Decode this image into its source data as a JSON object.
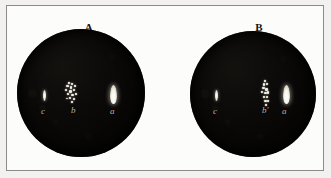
{
  "plate": {
    "background_color": "#fcfcfb",
    "frame_color": "#8b8b8b",
    "disk_color": "#0a0908",
    "highlight_color": "#ffffff"
  },
  "figures": [
    {
      "id": "figure-a",
      "title": "A",
      "disk": {
        "x": 17,
        "y": 29,
        "diameter": 128
      },
      "features": [
        {
          "key": "c",
          "label": "c",
          "type": "slit",
          "x": 43,
          "y": 90,
          "label_x": 41,
          "label_y": 107
        },
        {
          "key": "b",
          "label": "b",
          "type": "cluster",
          "x": 64,
          "y": 82,
          "label_x": 71,
          "label_y": 106
        },
        {
          "key": "a",
          "label": "a",
          "type": "teardrop",
          "x": 110,
          "y": 85,
          "label_x": 110,
          "label_y": 107
        }
      ]
    },
    {
      "id": "figure-b",
      "title": "B",
      "disk": {
        "x": 190,
        "y": 31,
        "diameter": 126
      },
      "features": [
        {
          "key": "c",
          "label": "c",
          "type": "slit",
          "x": 215,
          "y": 90,
          "label_x": 213,
          "label_y": 107
        },
        {
          "key": "b-prime",
          "label": "b'",
          "type": "cluster",
          "x": 260,
          "y": 80,
          "label_x": 262,
          "label_y": 106
        },
        {
          "key": "a",
          "label": "a",
          "type": "teardrop",
          "x": 283,
          "y": 85,
          "label_x": 282,
          "label_y": 107
        }
      ]
    }
  ],
  "specks": {
    "b": [
      {
        "x": 4,
        "y": 0,
        "w": 2,
        "h": 2
      },
      {
        "x": 7,
        "y": 1,
        "w": 2,
        "h": 2
      },
      {
        "x": 2,
        "y": 3,
        "w": 3,
        "h": 2
      },
      {
        "x": 6,
        "y": 4,
        "w": 2,
        "h": 3
      },
      {
        "x": 10,
        "y": 3,
        "w": 2,
        "h": 2
      },
      {
        "x": 1,
        "y": 7,
        "w": 2,
        "h": 2
      },
      {
        "x": 5,
        "y": 8,
        "w": 3,
        "h": 3
      },
      {
        "x": 9,
        "y": 7,
        "w": 2,
        "h": 2
      },
      {
        "x": 3,
        "y": 11,
        "w": 2,
        "h": 2
      },
      {
        "x": 7,
        "y": 12,
        "w": 3,
        "h": 2
      },
      {
        "x": 11,
        "y": 11,
        "w": 2,
        "h": 2
      },
      {
        "x": 5,
        "y": 15,
        "w": 2,
        "h": 2
      },
      {
        "x": 9,
        "y": 16,
        "w": 2,
        "h": 2
      },
      {
        "x": 2,
        "y": 16,
        "w": 2,
        "h": 1
      },
      {
        "x": 7,
        "y": 19,
        "w": 2,
        "h": 2
      }
    ],
    "b_prime": [
      {
        "x": 4,
        "y": 0,
        "w": 2,
        "h": 2
      },
      {
        "x": 3,
        "y": 3,
        "w": 2,
        "h": 3
      },
      {
        "x": 6,
        "y": 3,
        "w": 2,
        "h": 2
      },
      {
        "x": 2,
        "y": 7,
        "w": 3,
        "h": 2
      },
      {
        "x": 5,
        "y": 8,
        "w": 3,
        "h": 3
      },
      {
        "x": 1,
        "y": 11,
        "w": 2,
        "h": 2
      },
      {
        "x": 4,
        "y": 12,
        "w": 3,
        "h": 2
      },
      {
        "x": 7,
        "y": 11,
        "w": 2,
        "h": 3
      },
      {
        "x": 3,
        "y": 16,
        "w": 2,
        "h": 2
      },
      {
        "x": 6,
        "y": 16,
        "w": 2,
        "h": 2
      },
      {
        "x": 4,
        "y": 20,
        "w": 3,
        "h": 2
      },
      {
        "x": 7,
        "y": 20,
        "w": 2,
        "h": 2
      },
      {
        "x": 5,
        "y": 24,
        "w": 2,
        "h": 2
      }
    ]
  }
}
